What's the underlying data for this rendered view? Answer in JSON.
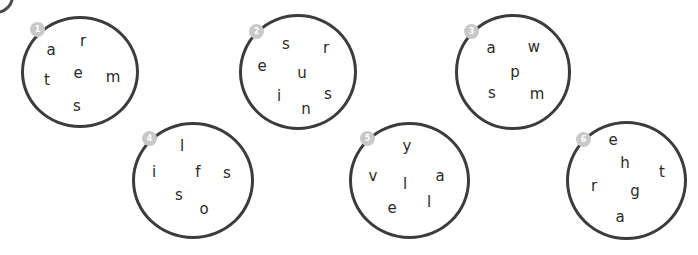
{
  "colors": {
    "circle_stroke": "#3c3c3c",
    "badge_fill": "#c8c8c8",
    "letter": "#2a2a2a"
  },
  "puzzles": [
    {
      "number": "1",
      "letters": [
        "a",
        "r",
        "t",
        "e",
        "m",
        "s"
      ]
    },
    {
      "number": "2",
      "letters": [
        "s",
        "r",
        "e",
        "u",
        "i",
        "s",
        "n"
      ]
    },
    {
      "number": "3",
      "letters": [
        "a",
        "w",
        "p",
        "s",
        "m"
      ]
    },
    {
      "number": "4",
      "letters": [
        "l",
        "i",
        "f",
        "s",
        "s",
        "o"
      ]
    },
    {
      "number": "5",
      "letters": [
        "y",
        "v",
        "a",
        "l",
        "e",
        "l"
      ]
    },
    {
      "number": "6",
      "letters": [
        "e",
        "h",
        "t",
        "r",
        "g",
        "a"
      ]
    }
  ]
}
